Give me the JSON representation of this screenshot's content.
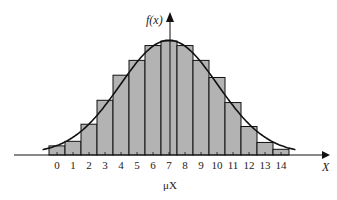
{
  "chart_data": {
    "type": "bar",
    "title": "",
    "xlabel": "X",
    "ylabel": "f(x)",
    "mean_label": "μX",
    "categories": [
      "0",
      "1",
      "2",
      "3",
      "4",
      "5",
      "6",
      "7",
      "8",
      "9",
      "10",
      "11",
      "12",
      "13",
      "14"
    ],
    "values": [
      0.08,
      0.12,
      0.27,
      0.48,
      0.7,
      0.83,
      0.96,
      1.0,
      0.96,
      0.83,
      0.68,
      0.46,
      0.25,
      0.11,
      0.05
    ],
    "overlay": {
      "type": "line",
      "name": "normal curve approximation",
      "smooth": true
    },
    "ylim": [
      0,
      1.0
    ],
    "grid": false,
    "legend": null,
    "colors": {
      "bar_fill": "#b3b3b3",
      "bar_stroke": "#111111",
      "curve": "#111111",
      "axis": "#111111"
    }
  }
}
